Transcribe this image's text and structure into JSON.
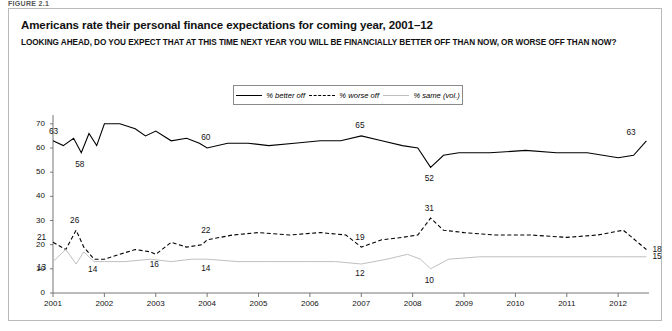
{
  "figure_label": "FIGURE 2.1",
  "title": "Americans rate their personal finance expectations for coming year, 2001–12",
  "subtitle": "LOOKING AHEAD, DO YOU EXPECT THAT AT THIS TIME NEXT YEAR YOU WILL BE FINANCIALLY BETTER OFF THAN NOW, OR WORSE OFF THAN NOW?",
  "legend": [
    {
      "label": "% better off",
      "style": "solid"
    },
    {
      "label": "% worse off",
      "style": "dashed"
    },
    {
      "label": "% same (vol.)",
      "style": "light"
    }
  ],
  "chart_data": {
    "type": "line",
    "title": "Americans rate their personal finance expectations for coming year, 2001–12",
    "xlabel": "",
    "ylabel": "",
    "ylim": [
      0,
      72
    ],
    "yticks": [
      0,
      10,
      20,
      30,
      40,
      50,
      60,
      70
    ],
    "xlim": [
      2001,
      2012.6
    ],
    "xticks": [
      2001,
      2002,
      2003,
      2004,
      2005,
      2006,
      2007,
      2008,
      2009,
      2010,
      2011,
      2012
    ],
    "grid": false,
    "legend_position": "top-center",
    "series": [
      {
        "name": "% better off",
        "style": "solid",
        "color": "#000000",
        "points": [
          {
            "x": 2001.0,
            "y": 63,
            "label": "63"
          },
          {
            "x": 2001.2,
            "y": 61
          },
          {
            "x": 2001.4,
            "y": 64
          },
          {
            "x": 2001.55,
            "y": 58,
            "label": "58"
          },
          {
            "x": 2001.7,
            "y": 66
          },
          {
            "x": 2001.85,
            "y": 61
          },
          {
            "x": 2002.0,
            "y": 70
          },
          {
            "x": 2002.3,
            "y": 70
          },
          {
            "x": 2002.6,
            "y": 68
          },
          {
            "x": 2002.8,
            "y": 65
          },
          {
            "x": 2003.0,
            "y": 67
          },
          {
            "x": 2003.3,
            "y": 63
          },
          {
            "x": 2003.6,
            "y": 64
          },
          {
            "x": 2003.85,
            "y": 62
          },
          {
            "x": 2004.0,
            "y": 60,
            "label": "60"
          },
          {
            "x": 2004.4,
            "y": 62
          },
          {
            "x": 2004.8,
            "y": 62
          },
          {
            "x": 2005.2,
            "y": 61
          },
          {
            "x": 2005.7,
            "y": 62
          },
          {
            "x": 2006.2,
            "y": 63
          },
          {
            "x": 2006.6,
            "y": 63
          },
          {
            "x": 2007.0,
            "y": 65,
            "label": "65"
          },
          {
            "x": 2007.4,
            "y": 63
          },
          {
            "x": 2007.8,
            "y": 61
          },
          {
            "x": 2008.1,
            "y": 60
          },
          {
            "x": 2008.35,
            "y": 52,
            "label": "52"
          },
          {
            "x": 2008.6,
            "y": 57
          },
          {
            "x": 2008.9,
            "y": 58
          },
          {
            "x": 2009.5,
            "y": 58
          },
          {
            "x": 2010.2,
            "y": 59
          },
          {
            "x": 2010.8,
            "y": 58
          },
          {
            "x": 2011.4,
            "y": 58
          },
          {
            "x": 2012.0,
            "y": 56
          },
          {
            "x": 2012.3,
            "y": 57
          },
          {
            "x": 2012.55,
            "y": 63,
            "label": "63"
          }
        ]
      },
      {
        "name": "% worse off",
        "style": "dashed",
        "color": "#000000",
        "points": [
          {
            "x": 2001.0,
            "y": 21,
            "label": "21"
          },
          {
            "x": 2001.25,
            "y": 18
          },
          {
            "x": 2001.45,
            "y": 26,
            "label": "26"
          },
          {
            "x": 2001.6,
            "y": 19
          },
          {
            "x": 2001.8,
            "y": 14,
            "label": "14"
          },
          {
            "x": 2002.0,
            "y": 14
          },
          {
            "x": 2002.3,
            "y": 16
          },
          {
            "x": 2002.6,
            "y": 18
          },
          {
            "x": 2002.9,
            "y": 17
          },
          {
            "x": 2003.0,
            "y": 16,
            "label": "16"
          },
          {
            "x": 2003.3,
            "y": 21
          },
          {
            "x": 2003.6,
            "y": 19
          },
          {
            "x": 2003.9,
            "y": 20
          },
          {
            "x": 2004.0,
            "y": 22,
            "label": "22"
          },
          {
            "x": 2004.5,
            "y": 24
          },
          {
            "x": 2005.0,
            "y": 25
          },
          {
            "x": 2005.6,
            "y": 24
          },
          {
            "x": 2006.2,
            "y": 25
          },
          {
            "x": 2006.7,
            "y": 24
          },
          {
            "x": 2007.0,
            "y": 19,
            "label": "19"
          },
          {
            "x": 2007.4,
            "y": 22
          },
          {
            "x": 2007.8,
            "y": 23
          },
          {
            "x": 2008.1,
            "y": 24
          },
          {
            "x": 2008.35,
            "y": 31,
            "label": "31"
          },
          {
            "x": 2008.6,
            "y": 26
          },
          {
            "x": 2009.0,
            "y": 25
          },
          {
            "x": 2009.6,
            "y": 24
          },
          {
            "x": 2010.3,
            "y": 24
          },
          {
            "x": 2011.0,
            "y": 23
          },
          {
            "x": 2011.6,
            "y": 24
          },
          {
            "x": 2012.1,
            "y": 26
          },
          {
            "x": 2012.55,
            "y": 18,
            "label": "18"
          }
        ]
      },
      {
        "name": "% same (vol.)",
        "style": "light",
        "color": "#bfbfbf",
        "points": [
          {
            "x": 2001.0,
            "y": 13,
            "label": "13"
          },
          {
            "x": 2001.25,
            "y": 18
          },
          {
            "x": 2001.45,
            "y": 12
          },
          {
            "x": 2001.6,
            "y": 17
          },
          {
            "x": 2001.8,
            "y": 13
          },
          {
            "x": 2002.0,
            "y": 13
          },
          {
            "x": 2002.4,
            "y": 13
          },
          {
            "x": 2002.9,
            "y": 14
          },
          {
            "x": 2003.3,
            "y": 13
          },
          {
            "x": 2003.7,
            "y": 14
          },
          {
            "x": 2004.0,
            "y": 14,
            "label": "14"
          },
          {
            "x": 2004.6,
            "y": 13
          },
          {
            "x": 2005.2,
            "y": 13
          },
          {
            "x": 2005.9,
            "y": 13
          },
          {
            "x": 2006.5,
            "y": 13
          },
          {
            "x": 2007.0,
            "y": 12,
            "label": "12"
          },
          {
            "x": 2007.5,
            "y": 14
          },
          {
            "x": 2007.9,
            "y": 16
          },
          {
            "x": 2008.15,
            "y": 14
          },
          {
            "x": 2008.35,
            "y": 10,
            "label": "10"
          },
          {
            "x": 2008.7,
            "y": 14
          },
          {
            "x": 2009.3,
            "y": 15
          },
          {
            "x": 2010.0,
            "y": 15
          },
          {
            "x": 2010.8,
            "y": 15
          },
          {
            "x": 2011.5,
            "y": 15
          },
          {
            "x": 2012.1,
            "y": 15
          },
          {
            "x": 2012.55,
            "y": 15,
            "label": "15"
          }
        ]
      }
    ]
  },
  "axis": {
    "yticks": [
      "0",
      "10",
      "20",
      "30",
      "40",
      "50",
      "60",
      "70"
    ],
    "xticks": [
      "2001",
      "2002",
      "2003",
      "2004",
      "2005",
      "2006",
      "2007",
      "2008",
      "2009",
      "2010",
      "2011",
      "2012"
    ]
  }
}
